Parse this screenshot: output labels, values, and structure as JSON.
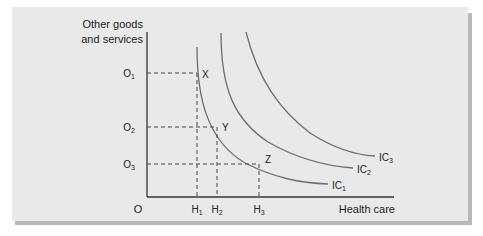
{
  "figure": {
    "y_axis_label_line1": "Other goods",
    "y_axis_label_line2": "and services",
    "x_axis_label": "Health care",
    "origin_label": "O",
    "y_ticks": [
      {
        "base": "O",
        "sub": "1"
      },
      {
        "base": "O",
        "sub": "2"
      },
      {
        "base": "O",
        "sub": "3"
      }
    ],
    "x_ticks": [
      {
        "base": "H",
        "sub": "1"
      },
      {
        "base": "H",
        "sub": "2"
      },
      {
        "base": "H",
        "sub": "3"
      }
    ],
    "points": [
      "X",
      "Y",
      "Z"
    ],
    "curves": [
      {
        "base": "IC",
        "sub": "1"
      },
      {
        "base": "IC",
        "sub": "2"
      },
      {
        "base": "IC",
        "sub": "3"
      }
    ],
    "colors": {
      "panel": "#e9e9e9",
      "shadow": "#b9b9b9",
      "curve": "#6e6e6e",
      "axis": "#333333"
    }
  }
}
